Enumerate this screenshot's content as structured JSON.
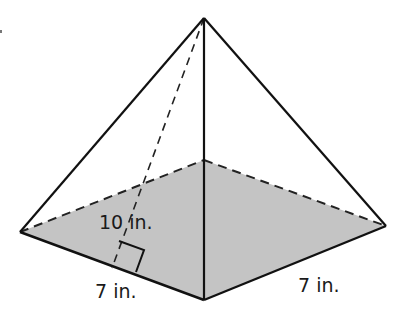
{
  "figure": {
    "type": "square-pyramid",
    "colors": {
      "edge": "#111111",
      "base_fill": "#c4c4c4",
      "background": "#ffffff"
    },
    "vertices": {
      "apex": [
        204,
        18
      ],
      "base_left": [
        20,
        232
      ],
      "base_back": [
        204,
        160
      ],
      "base_right": [
        386,
        226
      ],
      "base_front": [
        204,
        300
      ]
    },
    "labels": {
      "slant_height": "10 in.",
      "base_edge_left": "7 in.",
      "base_edge_right": "7 in."
    },
    "measurements": {
      "slant_height_in": 10,
      "base_side_in": 7
    }
  }
}
